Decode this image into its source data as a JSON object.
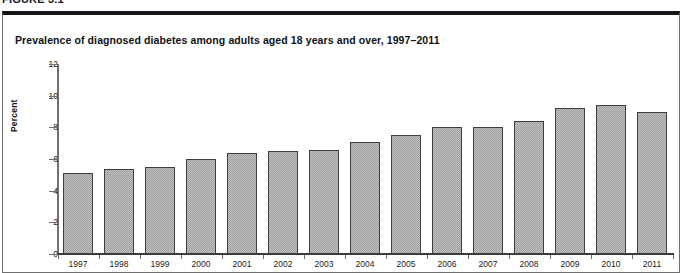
{
  "figure": {
    "number_label": "FIGURE 3.1",
    "panel_title": "Prevalence of diagnosed diabetes among adults aged 18 years and over, 1997–2011"
  },
  "chart_data": {
    "type": "bar",
    "title": "Prevalence of diagnosed diabetes among adults aged 18 years and over, 1997–2011",
    "xlabel": "",
    "ylabel": "Percent",
    "ylim": [
      0,
      12
    ],
    "yticks": [
      0,
      2,
      4,
      6,
      8,
      10,
      12
    ],
    "grid": false,
    "legend": null,
    "categories": [
      "1997",
      "1998",
      "1999",
      "2000",
      "2001",
      "2002",
      "2003",
      "2004",
      "2005",
      "2006",
      "2007",
      "2008",
      "2009",
      "2010",
      "2011"
    ],
    "values": [
      5.1,
      5.4,
      5.5,
      6.0,
      6.4,
      6.5,
      6.6,
      7.1,
      7.5,
      8.0,
      8.0,
      8.4,
      9.2,
      9.4,
      9.0
    ],
    "bar_color": "#9d9d9d",
    "bar_border_color": "#3e3e3e",
    "bar_fill_pattern": "checkered-dither"
  }
}
